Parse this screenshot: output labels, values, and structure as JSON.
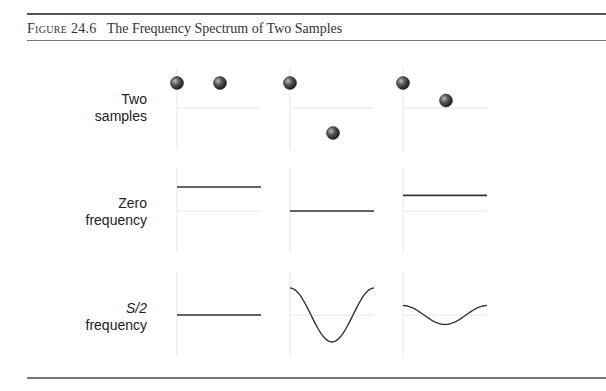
{
  "caption": {
    "figure_label": "Figure 24.6",
    "title": "The Frequency Spectrum of Two Samples"
  },
  "rows": [
    {
      "id": "two-samples",
      "line1": "Two",
      "line2": "samples",
      "line1_italic": false
    },
    {
      "id": "zero-frequency",
      "line1": "Zero",
      "line2": "frequency",
      "line1_italic": false
    },
    {
      "id": "s2-frequency",
      "line1": "S/2",
      "line2": "frequency",
      "line1_italic": true
    }
  ],
  "columns": [
    {
      "samples": [
        1.0,
        1.0
      ],
      "dc_level": 1.0,
      "s2_amplitude": 0.0
    },
    {
      "samples": [
        1.0,
        -1.0
      ],
      "dc_level": 0.0,
      "s2_amplitude": 1.0
    },
    {
      "samples": [
        1.0,
        0.3
      ],
      "dc_level": 0.65,
      "s2_amplitude": 0.35
    }
  ],
  "colors": {
    "rule": "#555555",
    "axis": "#e6e6e6",
    "line": "#333333",
    "dot": "#444444"
  }
}
